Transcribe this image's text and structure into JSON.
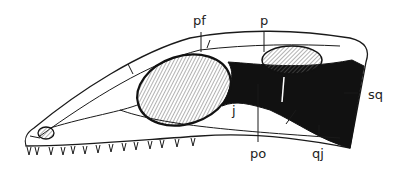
{
  "figure": {
    "labels": {
      "pf": "pf",
      "p": "p",
      "sq": "sq",
      "j": "j",
      "po": "po",
      "qj": "qj"
    },
    "colors": {
      "ink": "#1a1a1a",
      "background": "#ffffff",
      "hatch": "#555555"
    }
  }
}
